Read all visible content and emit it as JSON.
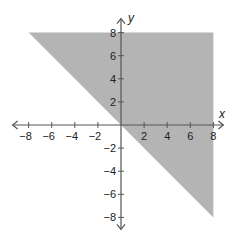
{
  "chart_data": {
    "type": "area",
    "title": "",
    "xlabel": "x",
    "ylabel": "y",
    "xlim": [
      -8,
      8
    ],
    "ylim": [
      -8,
      8
    ],
    "grid": false,
    "x_ticks": [
      -8,
      -6,
      -4,
      -2,
      2,
      4,
      6,
      8
    ],
    "y_ticks": [
      -8,
      -6,
      -4,
      -2,
      2,
      4,
      6,
      8
    ],
    "x_tick_labels": [
      "−8",
      "−6",
      "−4",
      "−2",
      "2",
      "4",
      "6",
      "8"
    ],
    "y_tick_labels": [
      "−8",
      "−6",
      "−4",
      "−2",
      "2",
      "4",
      "6",
      "8"
    ],
    "boundary_line": {
      "equation": "y = -x",
      "style": "none"
    },
    "shaded_region": {
      "inequality": "y >= -x",
      "polygon": [
        [
          -8,
          8
        ],
        [
          8,
          8
        ],
        [
          8,
          -8
        ]
      ],
      "color": "#b4b4b4"
    },
    "axis_color": "#555555"
  }
}
